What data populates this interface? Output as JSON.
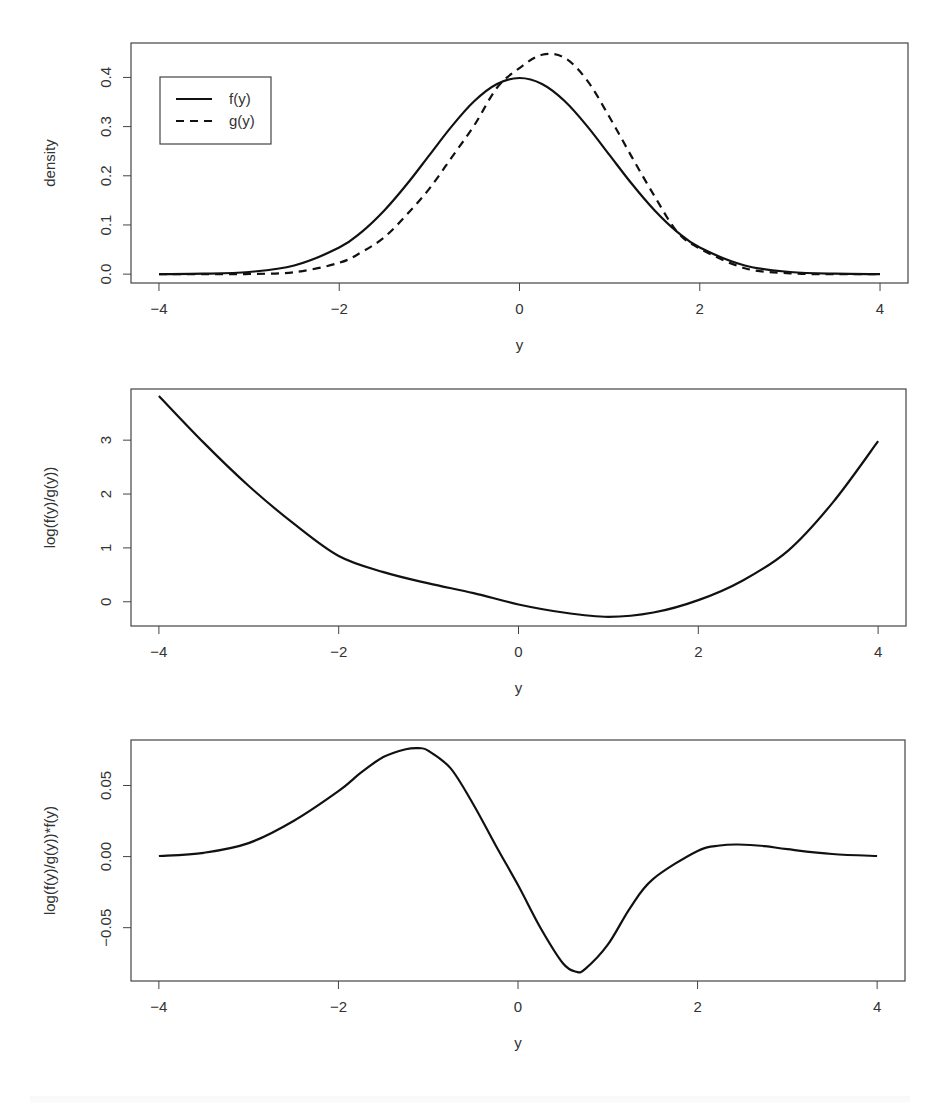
{
  "chart_data": [
    {
      "type": "line",
      "panel": 1,
      "title": "",
      "xlabel": "y",
      "ylabel": "density",
      "xlim": [
        -4,
        4
      ],
      "ylim": [
        -0.018,
        0.47
      ],
      "xticks": [
        "-4",
        "-2",
        "0",
        "2",
        "4"
      ],
      "yticks": [
        "0.0",
        "0.1",
        "0.2",
        "0.3",
        "0.4"
      ],
      "ytick_values": [
        0.0,
        0.1,
        0.2,
        0.3,
        0.4
      ],
      "grid": false,
      "legend": {
        "position": "top-left",
        "entries": [
          {
            "label": "f(y)",
            "style": "solid"
          },
          {
            "label": "g(y)",
            "style": "dashed"
          }
        ]
      },
      "x": [
        -4,
        -3.5,
        -3,
        -2.5,
        -2,
        -1.75,
        -1.5,
        -1.25,
        -1,
        -0.75,
        -0.5,
        -0.25,
        0,
        0.25,
        0.5,
        0.75,
        1,
        1.25,
        1.5,
        1.75,
        2,
        2.5,
        3,
        3.5,
        4
      ],
      "series": [
        {
          "name": "f(y)",
          "style": "solid",
          "values": [
            0.0001,
            0.0009,
            0.0044,
            0.0175,
            0.054,
            0.086,
            0.1295,
            0.1826,
            0.242,
            0.3011,
            0.3521,
            0.3867,
            0.3989,
            0.3867,
            0.3521,
            0.3011,
            0.242,
            0.1826,
            0.1295,
            0.086,
            0.054,
            0.0175,
            0.0044,
            0.0009,
            0.0001
          ]
        },
        {
          "name": "g(y)",
          "style": "dashed",
          "values": [
            0.0,
            0.0,
            0.0004,
            0.0039,
            0.023,
            0.045,
            0.075,
            0.121,
            0.174,
            0.238,
            0.303,
            0.379,
            0.419,
            0.446,
            0.44,
            0.394,
            0.319,
            0.237,
            0.158,
            0.086,
            0.052,
            0.012,
            0.0017,
            0.0001,
            0.0
          ]
        }
      ]
    },
    {
      "type": "line",
      "panel": 2,
      "title": "",
      "xlabel": "y",
      "ylabel": "log(f(y)/g(y))",
      "xlim": [
        -4,
        4
      ],
      "ylim": [
        -0.45,
        3.95
      ],
      "xticks": [
        "-4",
        "-2",
        "0",
        "2",
        "4"
      ],
      "yticks": [
        "0",
        "1",
        "2",
        "3"
      ],
      "ytick_values": [
        0,
        1,
        2,
        3
      ],
      "grid": false,
      "x": [
        -4,
        -3.5,
        -3,
        -2.5,
        -2,
        -1.5,
        -1,
        -0.5,
        0,
        0.5,
        1,
        1.5,
        2,
        2.5,
        3,
        3.5,
        4
      ],
      "series": [
        {
          "name": "log(f(y)/g(y))",
          "style": "solid",
          "values": [
            3.82,
            2.95,
            2.15,
            1.45,
            0.85,
            0.55,
            0.34,
            0.16,
            -0.05,
            -0.2,
            -0.28,
            -0.2,
            0.03,
            0.4,
            0.95,
            1.85,
            2.98
          ]
        }
      ]
    },
    {
      "type": "line",
      "panel": 3,
      "title": "",
      "xlabel": "y",
      "ylabel": "log(f(y)/g(y))*f(y)",
      "xlim": [
        -4,
        4
      ],
      "ylim": [
        -0.0875,
        0.082
      ],
      "xticks": [
        "-4",
        "-2",
        "0",
        "2",
        "4"
      ],
      "yticks": [
        "-0.05",
        "0.00",
        "0.05"
      ],
      "ytick_values": [
        -0.05,
        0.0,
        0.05
      ],
      "grid": false,
      "x": [
        -4,
        -3.5,
        -3,
        -2.5,
        -2,
        -1.75,
        -1.5,
        -1.25,
        -1.1,
        -1,
        -0.75,
        -0.5,
        -0.25,
        0,
        0.25,
        0.5,
        0.65,
        0.75,
        1,
        1.25,
        1.5,
        2,
        2.25,
        2.45,
        2.75,
        3,
        3.5,
        4
      ],
      "series": [
        {
          "name": "log(f(y)/g(y))*f(y)",
          "style": "solid",
          "values": [
            0.0004,
            0.0027,
            0.0095,
            0.025,
            0.046,
            0.059,
            0.07,
            0.0755,
            0.0762,
            0.0745,
            0.062,
            0.037,
            0.008,
            -0.02,
            -0.05,
            -0.075,
            -0.081,
            -0.079,
            -0.062,
            -0.036,
            -0.016,
            0.004,
            0.0078,
            0.0085,
            0.0074,
            0.0052,
            0.0018,
            0.0004
          ]
        }
      ]
    }
  ],
  "layout_panels": [
    {
      "box": [
        131,
        43,
        908,
        283
      ]
    },
    {
      "box": [
        131,
        389,
        906,
        626
      ]
    },
    {
      "box": [
        131,
        740,
        905,
        981
      ]
    }
  ]
}
